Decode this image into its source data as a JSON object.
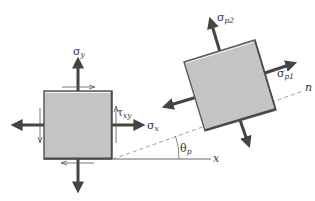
{
  "figure": {
    "type": "stress-element-transformation",
    "original_element": {
      "labels": {
        "sigma_y": {
          "symbol": "σ",
          "subscript": "y"
        },
        "sigma_x": {
          "symbol": "σ",
          "subscript": "x"
        },
        "tau_xy": {
          "symbol": "τ",
          "subscript": "xy"
        }
      }
    },
    "principal_element": {
      "labels": {
        "sigma_p1": {
          "symbol": "σ",
          "subscript": "p1"
        },
        "sigma_p2": {
          "symbol": "σ",
          "subscript": "p2"
        }
      }
    },
    "axes": {
      "x_label": "x",
      "n_label": "n",
      "angle_label": {
        "symbol": "θ",
        "subscript": "p"
      }
    },
    "colors": {
      "element_fill": "#c4c4c4",
      "element_edge": "#5a5a5a",
      "arrow": "#444444",
      "line": "#555555",
      "dashed": "#888888"
    }
  }
}
